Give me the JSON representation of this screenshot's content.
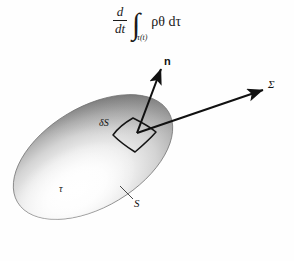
{
  "figure": {
    "background_color": "#fefefe",
    "ink_color": "#111111"
  },
  "formula": {
    "numerator": "d",
    "denominator": "dt",
    "integral_sign": "∫",
    "integral_subscript": "τ(t)",
    "integrand": "ρθ dτ",
    "plain_text": "d/dt ∫_{τ(t)} ρθ dτ"
  },
  "labels": {
    "normal_vector": "n",
    "sigma_surface": "Σ",
    "surface_element": "δS",
    "volume": "τ",
    "surface": "S"
  },
  "shape": {
    "name": "shaded-ellipsoid-blob",
    "highlight_color": "#ffffff",
    "mid_color": "#c9c9c9",
    "shadow_color": "#6e6e6e",
    "outline_color": "#5a5a5a",
    "rotation_degrees": -31
  },
  "arrows": [
    {
      "name": "normal-arrow",
      "label": "n",
      "from": [
        137,
        133
      ],
      "to": [
        161,
        68
      ]
    },
    {
      "name": "sigma-arrow",
      "label": "Σ",
      "from": [
        137,
        133
      ],
      "to": [
        266,
        89
      ]
    }
  ],
  "leaders": [
    {
      "name": "surface-leader",
      "label": "S",
      "from": [
        120,
        186
      ],
      "to": [
        134,
        199
      ]
    }
  ]
}
